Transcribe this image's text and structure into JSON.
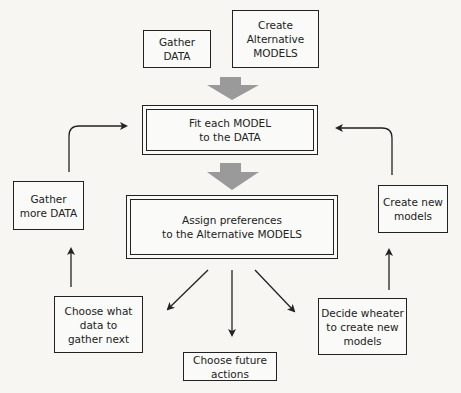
{
  "diagram": {
    "nodes": {
      "gather_data": "Gather\nDATA",
      "create_models": "Create\nAlternative\nMODELS",
      "fit_models": "Fit each  MODEL\nto the DATA",
      "assign_preferences": "Assign preferences\nto the Alternative MODELS",
      "gather_more_data": "Gather\nmore DATA",
      "create_new_models": "Create new\nmodels",
      "choose_data": "Choose what\ndata to\ngather next",
      "choose_actions": "Choose future\nactions",
      "decide_new_models": "Decide wheater\nto create new\nmodels"
    },
    "edges": [
      {
        "from": "gather_data+create_models",
        "to": "fit_models",
        "style": "block-gray"
      },
      {
        "from": "fit_models",
        "to": "assign_preferences",
        "style": "block-gray"
      },
      {
        "from": "assign_preferences",
        "to": "choose_data",
        "style": "arrow"
      },
      {
        "from": "assign_preferences",
        "to": "choose_actions",
        "style": "arrow"
      },
      {
        "from": "assign_preferences",
        "to": "decide_new_models",
        "style": "arrow"
      },
      {
        "from": "choose_data",
        "to": "gather_more_data",
        "style": "arrow"
      },
      {
        "from": "decide_new_models",
        "to": "create_new_models",
        "style": "arrow"
      },
      {
        "from": "gather_more_data",
        "to": "fit_models",
        "style": "curved-arrow"
      },
      {
        "from": "create_new_models",
        "to": "fit_models",
        "style": "curved-arrow"
      }
    ],
    "colors": {
      "line": "#222222",
      "block_arrow": "#9a9a9a",
      "background": "#f7f6f3"
    }
  }
}
